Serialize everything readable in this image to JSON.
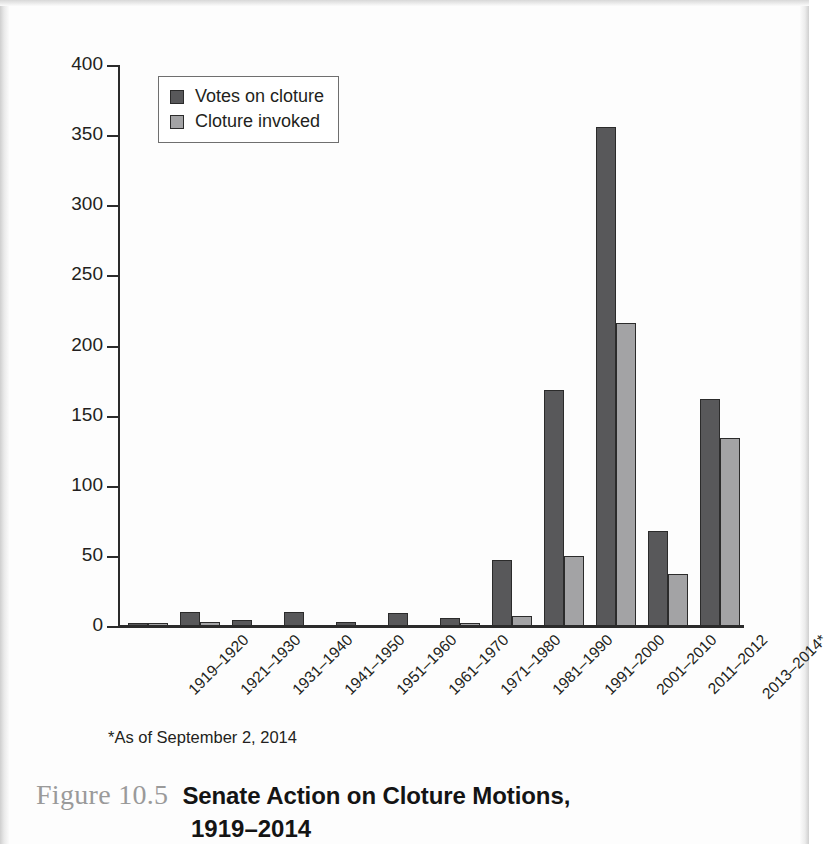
{
  "caption": {
    "figure_number": "Figure 10.5",
    "title_line1": "Senate Action on Cloture Motions,",
    "title_line2": "1919–2014"
  },
  "footnote": "*As of September 2, 2014",
  "legend": {
    "position": "top-left-inside",
    "items": [
      {
        "label": "Votes on cloture",
        "color": "#58585a"
      },
      {
        "label": "Cloture invoked",
        "color": "#a3a3a5"
      }
    ]
  },
  "yaxis": {
    "ticks": [
      "0",
      "50",
      "100",
      "150",
      "200",
      "250",
      "300",
      "350",
      "400"
    ]
  },
  "chart_data": {
    "type": "bar",
    "title": "Senate Action on Cloture Motions, 1919–2014",
    "xlabel": "",
    "ylabel": "",
    "ylim": [
      0,
      400
    ],
    "ytick_values": [
      0,
      50,
      100,
      150,
      200,
      250,
      300,
      350,
      400
    ],
    "grid": false,
    "legend_position": "upper left",
    "annotations": [
      "*As of September 2, 2014"
    ],
    "categories": [
      "1919–1920",
      "1921–1930",
      "1931–1940",
      "1941–1950",
      "1951–1960",
      "1961–1970",
      "1971–1980",
      "1981–1990",
      "1991–2000",
      "2001–2010",
      "2011–2012",
      "2013–2014*"
    ],
    "series": [
      {
        "name": "Votes on cloture",
        "color": "#58585a",
        "values": [
          2,
          10,
          4,
          10,
          3,
          9,
          6,
          47,
          168,
          356,
          68,
          162
        ]
      },
      {
        "name": "Cloture invoked",
        "color": "#a3a3a5",
        "values": [
          1,
          3,
          0,
          0,
          0,
          0,
          1,
          7,
          50,
          216,
          37,
          134
        ]
      }
    ]
  }
}
